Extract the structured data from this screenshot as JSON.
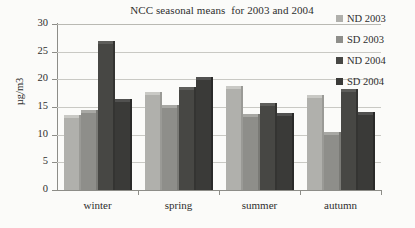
{
  "chart_data": {
    "type": "bar",
    "title": "NCC seasonal means  for 2003 and 2004",
    "xlabel": "",
    "ylabel": "µg/m3",
    "categories": [
      "winter",
      "spring",
      "summer",
      "autumn"
    ],
    "series": [
      {
        "name": "ND 2003",
        "color": "#b0b0ac",
        "values": [
          13.5,
          17.7,
          18.8,
          17.2
        ]
      },
      {
        "name": "SD 2003",
        "color": "#8e8e8a",
        "values": [
          14.5,
          15.4,
          13.7,
          10.4
        ]
      },
      {
        "name": "ND 2004",
        "color": "#474744",
        "values": [
          26.9,
          18.7,
          15.7,
          18.3
        ]
      },
      {
        "name": "SD 2004",
        "color": "#3a3a38",
        "values": [
          16.4,
          20.5,
          14.0,
          14.1
        ]
      }
    ],
    "ylim": [
      0,
      30
    ],
    "yticks": [
      0,
      5,
      10,
      15,
      20,
      25,
      30
    ],
    "ytick_labels": [
      "0",
      "5",
      "10",
      "15",
      "20",
      "25",
      "30"
    ],
    "grid": true,
    "legend_position": "right"
  },
  "legend": {
    "items": [
      {
        "label": "ND 2003"
      },
      {
        "label": "SD 2003"
      },
      {
        "label": "ND 2004"
      },
      {
        "label": "SD 2004"
      }
    ]
  }
}
